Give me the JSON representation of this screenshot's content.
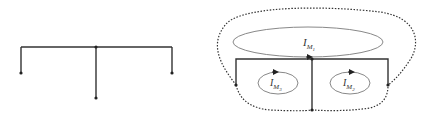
{
  "diagram": {
    "left_tree": {
      "description": "Tree topology: root node with three branches",
      "root": {
        "x": 96,
        "y": 47
      },
      "bus": {
        "x1": 21,
        "x2": 172,
        "y": 47
      },
      "branches": [
        {
          "x": 21,
          "y_end": 73
        },
        {
          "x": 96,
          "y_end": 98
        },
        {
          "x": 172,
          "y_end": 73
        }
      ]
    },
    "right_mesh": {
      "description": "Mesh/loop currents diagram with three mesh currents",
      "loops": [
        {
          "id": "M1",
          "label_main": "I",
          "label_sub": "M",
          "label_subsub": "1",
          "cx": 308,
          "cy": 42,
          "rx": 75,
          "ry": 15
        },
        {
          "id": "M3",
          "label_main": "I",
          "label_sub": "M",
          "label_subsub": "3",
          "cx": 278,
          "cy": 83,
          "rx": 20,
          "ry": 11
        },
        {
          "id": "M2",
          "label_main": "I",
          "label_sub": "M",
          "label_subsub": "2",
          "cx": 350,
          "cy": 83,
          "rx": 20,
          "ry": 11
        }
      ],
      "frame": {
        "x_left": 236,
        "x_right": 388,
        "y_top": 59,
        "center_x": 312,
        "y_bottom": 110,
        "side_bottom": 85
      },
      "colors": {
        "line": "#333333",
        "ellipse": "#888888",
        "dotted": "#333333"
      }
    }
  }
}
